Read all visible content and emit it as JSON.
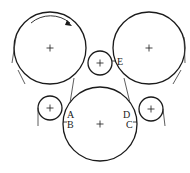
{
  "diagram": {
    "stroke_color": "#1a1a1a",
    "belt_color": "#333333",
    "background": "#ffffff",
    "circles": [
      {
        "id": "roller-top-left",
        "cx": 50,
        "cy": 48,
        "r": 36,
        "center_mark": "+"
      },
      {
        "id": "roller-top-right",
        "cx": 149,
        "cy": 48,
        "r": 36,
        "center_mark": "+"
      },
      {
        "id": "roller-middle-small",
        "cx": 100,
        "cy": 63,
        "r": 12,
        "center_mark": "+"
      },
      {
        "id": "roller-bottom",
        "cx": 100,
        "cy": 124,
        "r": 37,
        "center_mark": "+"
      },
      {
        "id": "roller-left-small",
        "cx": 50,
        "cy": 108,
        "r": 12,
        "center_mark": "+"
      },
      {
        "id": "roller-right-small",
        "cx": 151,
        "cy": 109,
        "r": 12,
        "center_mark": "+"
      }
    ],
    "labels": {
      "A": "A",
      "B": "B",
      "C": "C",
      "D": "D",
      "E": "E"
    },
    "rotation_arrow": "clockwise"
  }
}
